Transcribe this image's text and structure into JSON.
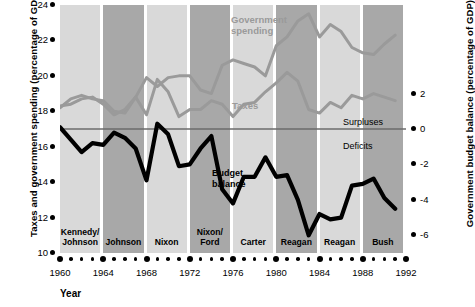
{
  "axes": {
    "left_title": "Taxes and government spending (percentage of GDP)",
    "right_title": "Government budget balance (percentage of GDP)",
    "x_title": "Year",
    "left_ticks": [
      "24",
      "22",
      "20",
      "18",
      "16",
      "14",
      "12",
      "10"
    ],
    "right_ticks": [
      "2",
      "0",
      "-2",
      "-4",
      "-6"
    ],
    "x_ticks": [
      "1960",
      "1964",
      "1968",
      "1972",
      "1976",
      "1980",
      "1984",
      "1988",
      "1992"
    ]
  },
  "annotations": {
    "government_spending": "Government\nspending",
    "government_spending_l1": "Government",
    "government_spending_l2": "spending",
    "taxes": "Taxes",
    "surpluses": "Surpluses",
    "deficits": "Deficits",
    "budget_balance_l1": "Budget",
    "budget_balance_l2": "balance"
  },
  "bands": [
    {
      "label_l1": "Kennedy/",
      "label_l2": "Johnson",
      "start": 1960,
      "end": 1964,
      "shade": "light"
    },
    {
      "label_l1": "",
      "label_l2": "Johnson",
      "start": 1964,
      "end": 1968,
      "shade": "dark"
    },
    {
      "label_l1": "",
      "label_l2": "Nixon",
      "start": 1968,
      "end": 1972,
      "shade": "light"
    },
    {
      "label_l1": "Nixon/",
      "label_l2": "Ford",
      "start": 1972,
      "end": 1976,
      "shade": "dark"
    },
    {
      "label_l1": "",
      "label_l2": "Carter",
      "start": 1976,
      "end": 1980,
      "shade": "light"
    },
    {
      "label_l1": "",
      "label_l2": "Reagan",
      "start": 1980,
      "end": 1984,
      "shade": "dark"
    },
    {
      "label_l1": "",
      "label_l2": "Reagan",
      "start": 1984,
      "end": 1988,
      "shade": "light"
    },
    {
      "label_l1": "",
      "label_l2": "Bush",
      "start": 1988,
      "end": 1992,
      "shade": "dark"
    }
  ],
  "colors": {
    "band_light": "#d9d9d9",
    "band_dark": "#a8a8a8",
    "gray_line": "#9a9a9a",
    "black_line": "#000000",
    "zero_line": "#6b6b6b",
    "background": "#ffffff"
  },
  "chart_data": {
    "type": "line",
    "title": "",
    "xlabel": "Year",
    "ylabel": "Taxes and government spending (percentage of GDP)",
    "ylabel_right": "Government budget balance (percentage of GDP)",
    "xlim": [
      1960,
      1992
    ],
    "ylim": [
      10,
      24
    ],
    "ylim_right": [
      -7,
      7
    ],
    "grid": false,
    "legend": "inline annotations",
    "x": [
      1960,
      1961,
      1962,
      1963,
      1964,
      1965,
      1966,
      1967,
      1968,
      1969,
      1970,
      1971,
      1972,
      1973,
      1974,
      1975,
      1976,
      1977,
      1978,
      1979,
      1980,
      1981,
      1982,
      1983,
      1984,
      1985,
      1986,
      1987,
      1988,
      1989,
      1990,
      1991
    ],
    "series": [
      {
        "name": "Government spending",
        "axis": "left",
        "color": "#9a9a9a",
        "values": [
          18.2,
          18.7,
          18.9,
          18.7,
          18.6,
          18.0,
          17.9,
          18.8,
          19.9,
          19.4,
          19.9,
          20.0,
          20.0,
          19.2,
          19.0,
          20.6,
          20.9,
          20.7,
          20.5,
          20.0,
          21.7,
          22.2,
          23.1,
          23.5,
          22.2,
          22.9,
          22.5,
          21.6,
          21.3,
          21.2,
          21.8,
          22.3
        ]
      },
      {
        "name": "Taxes",
        "axis": "left",
        "color": "#9a9a9a",
        "values": [
          18.3,
          18.4,
          18.7,
          18.8,
          18.4,
          17.8,
          18.1,
          18.8,
          17.8,
          19.8,
          19.1,
          17.7,
          18.1,
          18.1,
          18.6,
          18.4,
          17.7,
          18.4,
          18.5,
          19.1,
          19.6,
          20.2,
          19.7,
          18.1,
          17.9,
          18.5,
          18.2,
          18.9,
          18.7,
          19.0,
          18.8,
          18.6
        ]
      },
      {
        "name": "Budget balance",
        "axis": "right",
        "color": "#000000",
        "values": [
          0.1,
          -0.6,
          -1.3,
          -0.8,
          -0.9,
          -0.2,
          -0.5,
          -1.1,
          -2.9,
          0.3,
          -0.3,
          -2.1,
          -2.0,
          -1.1,
          -0.4,
          -3.4,
          -4.2,
          -2.7,
          -2.7,
          -1.6,
          -2.7,
          -2.6,
          -4.0,
          -6.0,
          -4.8,
          -5.1,
          -5.0,
          -3.2,
          -3.1,
          -2.8,
          -3.9,
          -4.5
        ]
      }
    ],
    "zero_line": 0,
    "annotations": [
      "Government spending",
      "Taxes",
      "Surpluses",
      "Deficits",
      "Budget balance"
    ]
  }
}
